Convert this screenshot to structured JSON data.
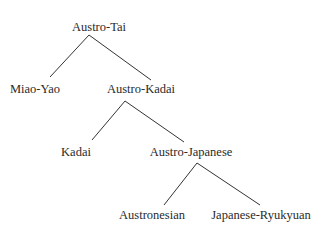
{
  "diagram": {
    "type": "tree",
    "nodes": {
      "root": "Austro-Tai",
      "miao_yao": "Miao-Yao",
      "austro_kadai": "Austro-Kadai",
      "kadai": "Kadai",
      "austro_japanese": "Austro-Japanese",
      "austronesian": "Austronesian",
      "japanese_ryukyuan": "Japanese-Ryukyuan"
    },
    "edges": [
      [
        "Austro-Tai",
        "Miao-Yao"
      ],
      [
        "Austro-Tai",
        "Austro-Kadai"
      ],
      [
        "Austro-Kadai",
        "Kadai"
      ],
      [
        "Austro-Kadai",
        "Austro-Japanese"
      ],
      [
        "Austro-Japanese",
        "Austronesian"
      ],
      [
        "Austro-Japanese",
        "Japanese-Ryukyuan"
      ]
    ],
    "line_color": "#333333"
  }
}
